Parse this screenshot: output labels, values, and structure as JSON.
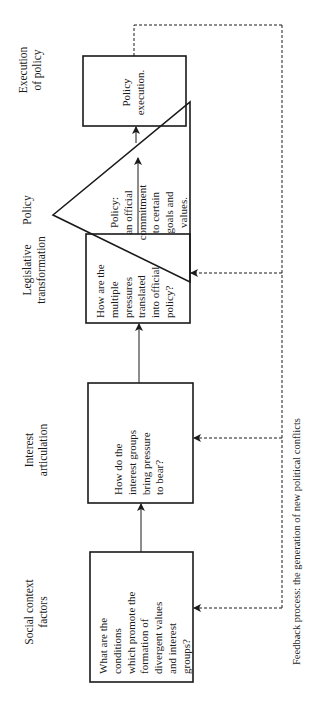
{
  "diagram": {
    "stages": [
      {
        "label": "Social context\nfactors",
        "box_text": "What are the\nconditions\nwhich promote the\nformation of\ndivergent values\nand interest\ngroups?"
      },
      {
        "label": "Interest\narticulation",
        "box_text": "How do the\ninterest groups\nbring pressure\nto bear?"
      },
      {
        "label": "Legislative\ntransformation",
        "box_text": "How are the\nmultiple\npressures\ntranslated\ninto official\npolicy?"
      },
      {
        "label": "Policy",
        "box_text": "Policy:\nan official\ncommitment\nto certain\ngoals and\nvalues."
      },
      {
        "label": "Execution\nof policy",
        "box_text": "Policy\nexecution."
      }
    ],
    "feedback_label": "Feedback process: the generation of new political conflicts",
    "colors": {
      "line": "#1a1a1a",
      "background": "#ffffff"
    }
  }
}
